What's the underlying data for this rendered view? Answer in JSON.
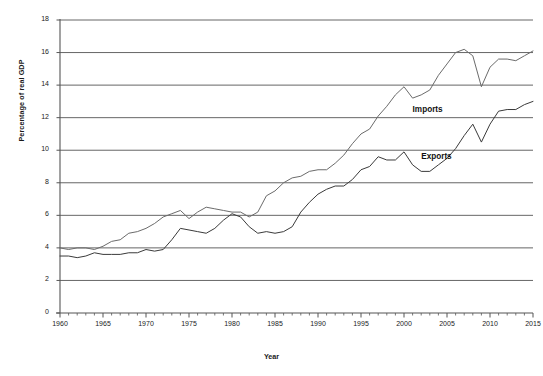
{
  "chart_data": {
    "type": "line",
    "title": "",
    "xlabel": "Year",
    "ylabel": "Percentage of real GDP",
    "xlim": [
      1960,
      2015
    ],
    "ylim": [
      0,
      18
    ],
    "grid": "horizontal",
    "legend_position": "inline-annotation",
    "x_ticks": [
      1960,
      1965,
      1970,
      1975,
      1980,
      1985,
      1990,
      1995,
      2000,
      2005,
      2010,
      2015
    ],
    "x_minor_tick_interval": 1,
    "y_ticks": [
      0,
      2,
      4,
      6,
      8,
      10,
      12,
      14,
      16,
      18
    ],
    "x": [
      1960,
      1961,
      1962,
      1963,
      1964,
      1965,
      1966,
      1967,
      1968,
      1969,
      1970,
      1971,
      1972,
      1973,
      1974,
      1975,
      1976,
      1977,
      1978,
      1979,
      1980,
      1981,
      1982,
      1983,
      1984,
      1985,
      1986,
      1987,
      1988,
      1989,
      1990,
      1991,
      1992,
      1993,
      1994,
      1995,
      1996,
      1997,
      1998,
      1999,
      2000,
      2001,
      2002,
      2003,
      2004,
      2005,
      2006,
      2007,
      2008,
      2009,
      2010,
      2011,
      2012,
      2013,
      2014,
      2015
    ],
    "series": [
      {
        "name": "Imports",
        "color": "#6b6b6b",
        "values": [
          4.0,
          3.9,
          4.0,
          4.0,
          3.9,
          4.1,
          4.4,
          4.5,
          4.9,
          5.0,
          5.2,
          5.5,
          5.9,
          6.1,
          6.3,
          5.8,
          6.2,
          6.5,
          6.4,
          6.3,
          6.2,
          6.2,
          5.9,
          6.2,
          7.2,
          7.5,
          8.0,
          8.3,
          8.4,
          8.7,
          8.8,
          8.8,
          9.2,
          9.7,
          10.4,
          11.0,
          11.3,
          12.1,
          12.7,
          13.4,
          13.9,
          13.2,
          13.4,
          13.7,
          14.6,
          15.3,
          16.0,
          16.2,
          15.8,
          13.9,
          15.1,
          15.6,
          15.6,
          15.5,
          15.8,
          16.1
        ],
        "label_point": {
          "x": 2001,
          "y": 12.5
        }
      },
      {
        "name": "Exports",
        "color": "#3a3a3a",
        "values": [
          3.5,
          3.5,
          3.4,
          3.5,
          3.7,
          3.6,
          3.6,
          3.6,
          3.7,
          3.7,
          3.9,
          3.8,
          3.9,
          4.5,
          5.2,
          5.1,
          5.0,
          4.9,
          5.2,
          5.7,
          6.1,
          5.9,
          5.3,
          4.9,
          5.0,
          4.9,
          5.0,
          5.3,
          6.2,
          6.8,
          7.3,
          7.6,
          7.8,
          7.8,
          8.2,
          8.8,
          9.0,
          9.6,
          9.4,
          9.4,
          9.9,
          9.1,
          8.7,
          8.7,
          9.1,
          9.5,
          10.1,
          10.9,
          11.6,
          10.5,
          11.6,
          12.4,
          12.5,
          12.5,
          12.8,
          13.0
        ],
        "label_point": {
          "x": 2002,
          "y": 9.6
        }
      }
    ]
  },
  "axis": {
    "y_title": "Percentage of real GDP",
    "x_title": "Year"
  },
  "footer": {
    "caption": ""
  }
}
